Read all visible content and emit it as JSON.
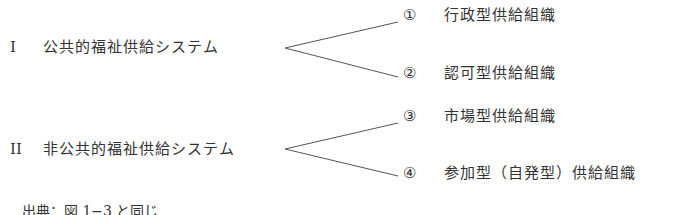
{
  "diagram": {
    "categories": [
      {
        "numeral": "I",
        "label": "公共的福祉供給システム",
        "children": [
          {
            "marker": "①",
            "label": "行政型供給組織"
          },
          {
            "marker": "②",
            "label": "認可型供給組織"
          }
        ]
      },
      {
        "numeral": "II",
        "label": "非公共的福祉供給システム",
        "children": [
          {
            "marker": "③",
            "label": "市場型供給組織"
          },
          {
            "marker": "④",
            "label": "参加型（自発型）供給組織"
          }
        ]
      }
    ],
    "source": "出典：図 1−3 と同じ"
  },
  "colors": {
    "text": "#333333",
    "line": "#555555",
    "background": "#ffffff"
  }
}
